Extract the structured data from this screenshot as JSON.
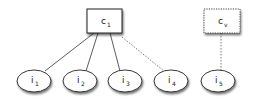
{
  "diagram": {
    "type": "tree",
    "nodes": [
      {
        "id": "c1",
        "label": "c",
        "sub": "1",
        "shape": "rect",
        "border": "solid"
      },
      {
        "id": "cv",
        "label": "c",
        "sub": "v",
        "shape": "rect",
        "border": "dotted"
      },
      {
        "id": "i1",
        "label": "i",
        "sub": "1",
        "shape": "ellipse"
      },
      {
        "id": "i2",
        "label": "i",
        "sub": "2",
        "shape": "ellipse"
      },
      {
        "id": "i3",
        "label": "i",
        "sub": "3",
        "shape": "ellipse"
      },
      {
        "id": "i4",
        "label": "i",
        "sub": "4",
        "shape": "ellipse"
      },
      {
        "id": "i5",
        "label": "i",
        "sub": "5",
        "shape": "ellipse"
      }
    ],
    "edges": [
      {
        "from": "c1",
        "to": "i1",
        "style": "solid"
      },
      {
        "from": "c1",
        "to": "i2",
        "style": "solid"
      },
      {
        "from": "c1",
        "to": "i3",
        "style": "solid"
      },
      {
        "from": "c1",
        "to": "i4",
        "style": "dotted"
      },
      {
        "from": "cv",
        "to": "i5",
        "style": "dotted"
      }
    ]
  }
}
